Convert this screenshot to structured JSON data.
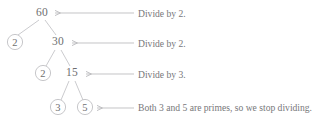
{
  "diagram": {
    "line_color": "#b9b9bc",
    "text_color": "#6e6e70",
    "annotation_color": "#77777a",
    "background": "#ffffff",
    "nodes": [
      {
        "id": "n60",
        "value": "60",
        "circled": false,
        "x": 42,
        "y": 13,
        "level": 0
      },
      {
        "id": "n2a",
        "value": "2",
        "circled": true,
        "x": 15,
        "y": 42,
        "level": 1
      },
      {
        "id": "n30",
        "value": "30",
        "circled": false,
        "x": 58,
        "y": 42,
        "level": 1
      },
      {
        "id": "n2b",
        "value": "2",
        "circled": true,
        "x": 43,
        "y": 73,
        "level": 2
      },
      {
        "id": "n15",
        "value": "15",
        "circled": false,
        "x": 72,
        "y": 73,
        "level": 2
      },
      {
        "id": "n3",
        "value": "3",
        "circled": true,
        "x": 58,
        "y": 107,
        "level": 3
      },
      {
        "id": "n5",
        "value": "5",
        "circled": true,
        "x": 85,
        "y": 107,
        "level": 3
      }
    ],
    "edges": [
      {
        "from": "n60",
        "to": "n2a"
      },
      {
        "from": "n60",
        "to": "n30"
      },
      {
        "from": "n30",
        "to": "n2b"
      },
      {
        "from": "n30",
        "to": "n15"
      },
      {
        "from": "n15",
        "to": "n3"
      },
      {
        "from": "n15",
        "to": "n5"
      }
    ]
  },
  "annotations": [
    {
      "id": "a1",
      "text": "Divide by 2.",
      "target_node": "n60",
      "arrow_tip_x": 55,
      "arrow_y": 13,
      "arrow_tail_x": 134,
      "text_x": 138,
      "text_y": 13
    },
    {
      "id": "a2",
      "text": "Divide by 2.",
      "target_node": "n30",
      "arrow_tip_x": 72,
      "arrow_y": 43,
      "arrow_tail_x": 134,
      "text_x": 138,
      "text_y": 43
    },
    {
      "id": "a3",
      "text": "Divide by 3.",
      "target_node": "n15",
      "arrow_tip_x": 86,
      "arrow_y": 74,
      "arrow_tail_x": 134,
      "text_x": 138,
      "text_y": 74
    },
    {
      "id": "a4",
      "text": "Both 3 and 5 are primes, so we stop dividing.",
      "target_node": "n5",
      "arrow_tip_x": 97,
      "arrow_y": 108,
      "arrow_tail_x": 134,
      "text_x": 138,
      "text_y": 102
    }
  ]
}
